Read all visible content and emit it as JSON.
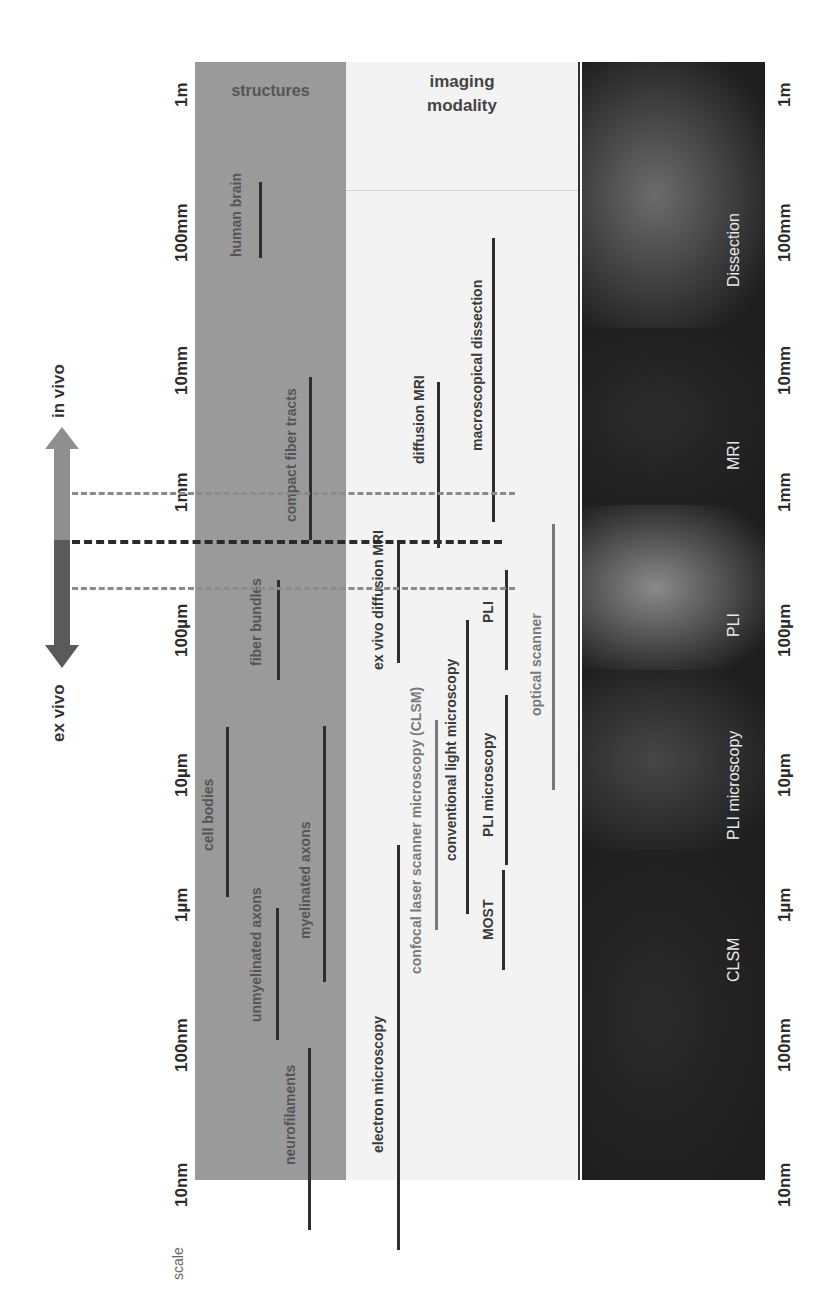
{
  "headers": {
    "structures": "structures",
    "imaging_modality_line1": "imaging",
    "imaging_modality_line2": "modality"
  },
  "scale": {
    "label": "scale",
    "ticks": [
      {
        "label": "1m",
        "y": 95
      },
      {
        "label": "100mm",
        "y": 233
      },
      {
        "label": "10mm",
        "y": 370
      },
      {
        "label": "1mm",
        "y": 492
      },
      {
        "label": "100µm",
        "y": 630
      },
      {
        "label": "10µm",
        "y": 775
      },
      {
        "label": "1µm",
        "y": 905
      },
      {
        "label": "100nm",
        "y": 1045
      },
      {
        "label": "10nm",
        "y": 1185
      }
    ]
  },
  "arrow": {
    "top_label": "in vivo",
    "bottom_label": "ex vivo",
    "top_color": "#8f8f8f",
    "bottom_color": "#5a5a5a"
  },
  "thresholds": [
    {
      "y": 492,
      "color": "#8a8a8a",
      "x_end": 515,
      "weight": 3
    },
    {
      "y": 540,
      "color": "#2a2a2a",
      "x_end": 502,
      "weight": 4
    },
    {
      "y": 587,
      "color": "#8a8a8a",
      "x_end": 515,
      "weight": 3
    }
  ],
  "structures": [
    {
      "label": "human brain",
      "line_x": 259,
      "y1": 182,
      "y2": 258,
      "text_x": 228,
      "text_center": 215
    },
    {
      "label": "compact fiber tracts",
      "line_x": 309,
      "y1": 377,
      "y2": 540,
      "text_x": 283,
      "text_center": 455
    },
    {
      "label": "fiber bundles",
      "line_x": 277,
      "y1": 580,
      "y2": 680,
      "text_x": 248,
      "text_center": 622
    },
    {
      "label": "cell bodies",
      "line_x": 226,
      "y1": 727,
      "y2": 897,
      "text_x": 200,
      "text_center": 815
    },
    {
      "label": "myelinated axons",
      "line_x": 323,
      "y1": 726,
      "y2": 982,
      "text_x": 297,
      "text_center": 880
    },
    {
      "label": "unmyelinated axons",
      "line_x": 276,
      "y1": 908,
      "y2": 1040,
      "text_x": 248,
      "text_center": 955
    },
    {
      "label": "neurofilaments",
      "line_x": 308,
      "y1": 1048,
      "y2": 1230,
      "text_x": 282,
      "text_center": 1115
    }
  ],
  "modalities": [
    {
      "label": "macroscopical dissection",
      "line_x": 492,
      "y1": 238,
      "y2": 522,
      "text_x": 469,
      "text_center": 365,
      "dim": false
    },
    {
      "label": "diffusion MRI",
      "line_x": 437,
      "y1": 382,
      "y2": 548,
      "text_x": 411,
      "text_center": 420,
      "dim": false
    },
    {
      "label": "ex vivo diffusion MRI",
      "line_x": 397,
      "y1": 540,
      "y2": 663,
      "text_x": 370,
      "text_center": 600,
      "dim": false
    },
    {
      "label": "PLI",
      "line_x": 505,
      "y1": 570,
      "y2": 670,
      "text_x": 480,
      "text_center": 612,
      "dim": false
    },
    {
      "label": "optical scanner",
      "line_x": 552,
      "y1": 524,
      "y2": 790,
      "text_x": 528,
      "text_center": 665,
      "dim": true
    },
    {
      "label": "confocal laser scanner microscopy (CLSM)",
      "line_x": 435,
      "y1": 720,
      "y2": 930,
      "text_x": 408,
      "text_center": 830,
      "dim": true
    },
    {
      "label": "conventional light microscopy",
      "line_x": 466,
      "y1": 620,
      "y2": 914,
      "text_x": 443,
      "text_center": 760,
      "dim": false
    },
    {
      "label": "PLI microscopy",
      "line_x": 505,
      "y1": 695,
      "y2": 865,
      "text_x": 480,
      "text_center": 785,
      "dim": false
    },
    {
      "label": "MOST",
      "line_x": 502,
      "y1": 870,
      "y2": 970,
      "text_x": 480,
      "text_center": 920,
      "dim": false
    },
    {
      "label": "electron microscopy",
      "line_x": 397,
      "y1": 845,
      "y2": 1250,
      "text_x": 370,
      "text_center": 1085,
      "dim": false
    }
  ],
  "photos": [
    {
      "label": "Dissection",
      "y1": 62,
      "y2": 328,
      "label_center": 250,
      "color": "#6c6c6c"
    },
    {
      "label": "MRI",
      "y1": 328,
      "y2": 505,
      "label_center": 455,
      "color": "#2b2b2b"
    },
    {
      "label": "PLI",
      "y1": 505,
      "y2": 670,
      "label_center": 625,
      "color": "#8a8a8a"
    },
    {
      "label": "PLI microscopy",
      "y1": 670,
      "y2": 850,
      "label_center": 785,
      "color": "#474747"
    },
    {
      "label": "CLSM",
      "y1": 850,
      "y2": 1180,
      "label_center": 960,
      "color": "#2a2a2a"
    }
  ]
}
